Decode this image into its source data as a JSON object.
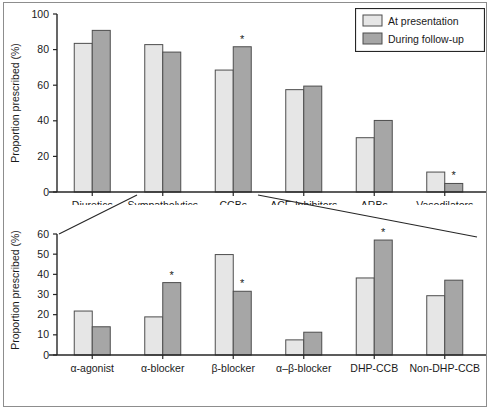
{
  "figure": {
    "background_color": "#ffffff",
    "border_color": "#8d8d8d",
    "axis_color": "#262626",
    "light_bar_color": "#e6e6e6",
    "dark_bar_color": "#a6a6a6",
    "bar_edge_color": "#4d4d4d",
    "significance_marker": "*"
  },
  "legend": {
    "position": "top-right",
    "entries": [
      {
        "label": "At presentation",
        "color": "#e6e6e6",
        "swatch_name": "light-swatch"
      },
      {
        "label": "During follow-up",
        "color": "#a6a6a6",
        "swatch_name": "dark-swatch"
      }
    ]
  },
  "chart_data": [
    {
      "id": "top",
      "type": "bar",
      "title": "",
      "xlabel": "",
      "ylabel": "Proportion prescribed (%)",
      "ylim": [
        0,
        100
      ],
      "yticks": [
        0,
        20,
        40,
        60,
        80,
        100
      ],
      "ytick_labels": [
        "0",
        "20",
        "40",
        "60",
        "80",
        "100"
      ],
      "grid": false,
      "legend_position": "top-right",
      "categories": [
        "Diuretics",
        "Sympatholytics",
        "CCBs",
        "ACE-inhibitors",
        "ARBs",
        "Vasodilators"
      ],
      "series": [
        {
          "name": "At presentation",
          "values": [
            83.5,
            82.8,
            68.5,
            57.5,
            30.5,
            11.2
          ]
        },
        {
          "name": "During follow-up",
          "values": [
            90.8,
            78.6,
            81.6,
            59.5,
            40.2,
            4.8
          ]
        }
      ],
      "annotations": [
        {
          "category": "CCBs",
          "series": "During follow-up",
          "marker": "*"
        },
        {
          "category": "Vasodilators",
          "series": "During follow-up",
          "marker": "*"
        }
      ]
    },
    {
      "id": "bottom",
      "type": "bar",
      "title": "",
      "xlabel": "",
      "ylabel": "Proportion prescribed (%)",
      "ylim": [
        0,
        60
      ],
      "yticks": [
        0,
        10,
        20,
        30,
        40,
        50,
        60
      ],
      "ytick_labels": [
        "0",
        "10",
        "20",
        "30",
        "40",
        "50",
        "60"
      ],
      "grid": false,
      "legend_position": "none",
      "categories": [
        "α-agonist",
        "α-blocker",
        "β-blocker",
        "α–β-blocker",
        "DHP-CCB",
        "Non-DHP-CCB"
      ],
      "series": [
        {
          "name": "At presentation",
          "values": [
            21.8,
            18.9,
            49.8,
            7.5,
            38.2,
            29.4
          ]
        },
        {
          "name": "During follow-up",
          "values": [
            14.0,
            35.9,
            31.6,
            11.3,
            57.0,
            37.1
          ]
        }
      ],
      "annotations": [
        {
          "category": "α-blocker",
          "series": "During follow-up",
          "marker": "*"
        },
        {
          "category": "β-blocker",
          "series": "During follow-up",
          "marker": "*"
        },
        {
          "category": "DHP-CCB",
          "series": "During follow-up",
          "marker": "*"
        }
      ]
    }
  ],
  "zoom_connectors": {
    "description": "Lines linking the Sympatholytics group of the top panel to the expanded lower panel",
    "from_category": "Sympatholytics"
  }
}
